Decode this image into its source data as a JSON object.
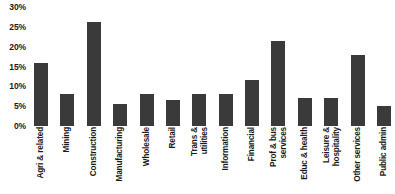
{
  "chart_data": {
    "type": "bar",
    "title": "",
    "xlabel": "",
    "ylabel": "",
    "ylim": [
      0,
      30
    ],
    "grid": false,
    "legend": null,
    "bar_color": "#3a3a3a",
    "y_ticks": [
      "0%",
      "5%",
      "10%",
      "15%",
      "20%",
      "25%",
      "30%"
    ],
    "y_tick_values": [
      0,
      5,
      10,
      15,
      20,
      25,
      30
    ],
    "categories": [
      "Agri & related",
      "Mining",
      "Construction",
      "Manufacturing",
      "Wholesale",
      "Retail",
      "Trans & utilities",
      "Information",
      "Financial",
      "Prof & bus services",
      "Educ & health",
      "Leisure & hospitality",
      "Other services",
      "Public admin"
    ],
    "category_lines": [
      [
        "Agri & related"
      ],
      [
        "Mining"
      ],
      [
        "Construction"
      ],
      [
        "Manufacturing"
      ],
      [
        "Wholesale"
      ],
      [
        "Retail"
      ],
      [
        "Trans &",
        "utilities"
      ],
      [
        "Information"
      ],
      [
        "Financial"
      ],
      [
        "Prof & bus",
        "services"
      ],
      [
        "Educ & health"
      ],
      [
        "Leisure &",
        "hospitality"
      ],
      [
        "Other services"
      ],
      [
        "Public admin"
      ]
    ],
    "values": [
      16.0,
      8.0,
      26.3,
      5.5,
      8.0,
      6.5,
      8.0,
      8.0,
      11.5,
      21.5,
      7.0,
      7.0,
      18.0,
      5.0
    ]
  }
}
